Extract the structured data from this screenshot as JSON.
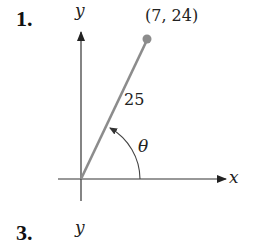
{
  "problems": [
    {
      "number": "1.",
      "axis_x_label": "x",
      "axis_y_label": "y",
      "point_label": "(7, 24)",
      "point": {
        "x": 7,
        "y": 24
      },
      "hypotenuse_label": "25",
      "angle_label": "θ"
    },
    {
      "number": "3.",
      "axis_y_label": "y"
    }
  ],
  "colors": {
    "axis": "#333333",
    "terminal_side": "#8c8c8c",
    "point": "#8c8c8c",
    "arc": "#444444"
  }
}
